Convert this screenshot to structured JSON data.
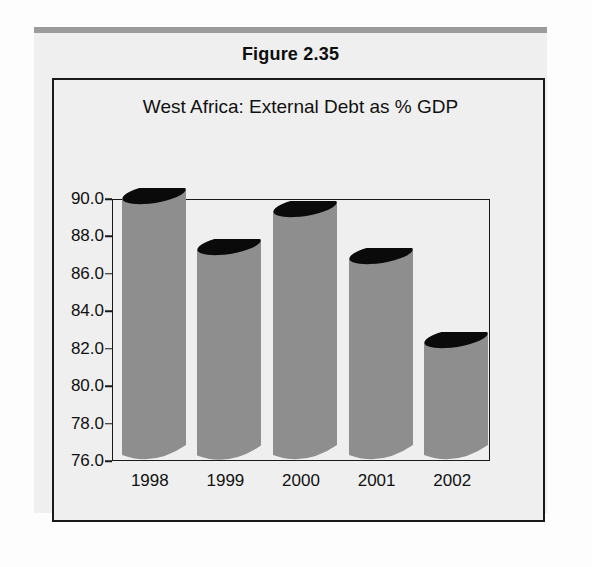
{
  "figure": {
    "caption": "Figure 2.35"
  },
  "chart_data": {
    "type": "bar",
    "title": "West Africa: External Debt as % GDP",
    "xlabel": "",
    "ylabel": "",
    "categories": [
      "1998",
      "1999",
      "2000",
      "2001",
      "2002"
    ],
    "values": [
      90.0,
      87.3,
      89.3,
      86.8,
      82.3
    ],
    "ytick_labels": [
      "90.0",
      "88.0",
      "86.0",
      "84.0",
      "82.0",
      "80.0",
      "78.0",
      "76.0"
    ],
    "ytick_values": [
      90.0,
      88.0,
      86.0,
      84.0,
      82.0,
      80.0,
      78.0,
      76.0
    ],
    "ylim": [
      76.0,
      90.0
    ],
    "grid": false,
    "legend": null,
    "style": {
      "bar_fill": "#8e8e8e",
      "bar_top": "#0a0a0a",
      "axis_color": "#1a1a1a",
      "panel_bg": "#efefef",
      "text_color": "#111111",
      "rule_color": "#9c9c9c"
    }
  }
}
